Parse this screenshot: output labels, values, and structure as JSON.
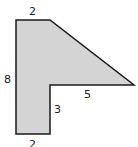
{
  "diagram": {
    "type": "composite-shape",
    "fill": "#d4d4d4",
    "stroke": "#1a1a1a",
    "labels": {
      "top": "2",
      "left": "8",
      "hypotenuse_base": "5",
      "inner_vertical": "3",
      "bottom": "2"
    }
  }
}
